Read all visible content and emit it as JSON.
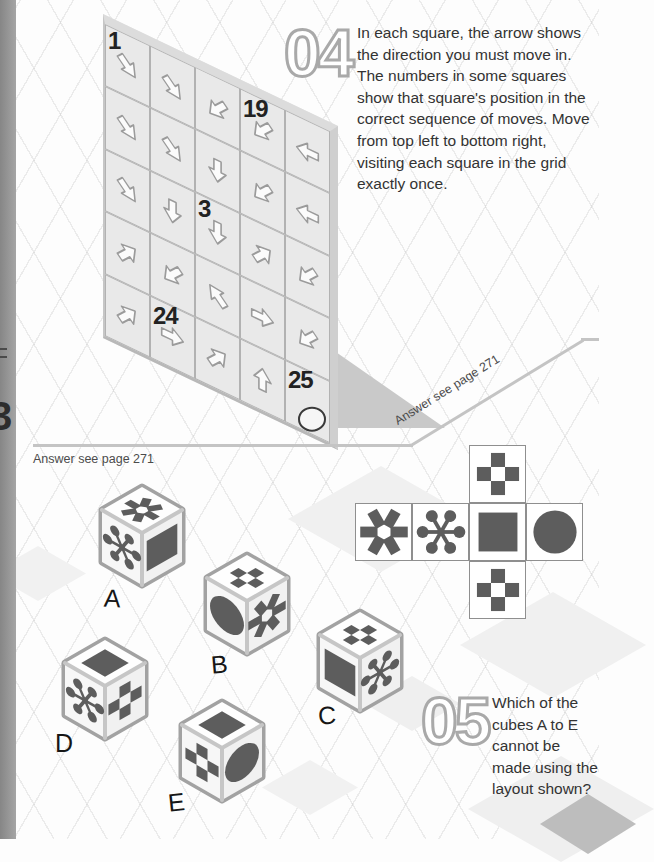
{
  "page_edge": {
    "label": "3"
  },
  "puzzle04": {
    "number": "04",
    "description": "In each square, the arrow shows the direction you must move in. The numbers in some squares show that square's position in the correct sequence of moves. Move from top left to bottom right, visiting each square in the grid exactly once.",
    "answer_note": "Answer see page 271",
    "grid": {
      "rows": 5,
      "cols": 5,
      "cells": [
        {
          "num": "1",
          "dir": "SE"
        },
        {
          "dir": "SE"
        },
        {
          "dir": "SW"
        },
        {
          "num": "19",
          "dir": "SW"
        },
        {
          "dir": "W"
        },
        {
          "dir": "SE"
        },
        {
          "dir": "SE"
        },
        {
          "dir": "S"
        },
        {
          "dir": "SW"
        },
        {
          "dir": "W"
        },
        {
          "dir": "SE"
        },
        {
          "dir": "S"
        },
        {
          "num": "3",
          "dir": "S"
        },
        {
          "dir": "NE"
        },
        {
          "dir": "SW"
        },
        {
          "dir": "NE"
        },
        {
          "dir": "SW"
        },
        {
          "dir": "NW"
        },
        {
          "dir": "E"
        },
        {
          "dir": "SW"
        },
        {
          "dir": "NE"
        },
        {
          "num": "24",
          "dir": "E"
        },
        {
          "dir": "NE"
        },
        {
          "dir": "N"
        },
        {
          "num": "25",
          "end": true
        }
      ]
    }
  },
  "puzzle05": {
    "number": "05",
    "question": "Which of the cubes A to E cannot be made using the layout shown?",
    "answer_note": "Answer see page 271",
    "net": {
      "middle_row": [
        "six-blade-asterisk",
        "six-dot-snowflake",
        "solid-square",
        "solid-circle"
      ],
      "above_third": "checkered-plus",
      "below_third": "checkered-plus"
    },
    "dice": [
      {
        "label": "A",
        "top": "six-blade-asterisk",
        "left": "six-dot-snowflake",
        "right": "solid-square"
      },
      {
        "label": "B",
        "top": "checkered-plus",
        "left": "solid-circle",
        "right": "six-blade-asterisk"
      },
      {
        "label": "C",
        "top": "checkered-plus",
        "left": "solid-square",
        "right": "six-dot-snowflake"
      },
      {
        "label": "D",
        "top": "solid-square",
        "left": "six-dot-snowflake",
        "right": "checkered-plus"
      },
      {
        "label": "E",
        "top": "solid-square",
        "left": "checkered-plus",
        "right": "solid-circle"
      }
    ]
  },
  "colors": {
    "shape_dark": "#5d5d5d",
    "wall_face": "#e9e9e9",
    "grid_line": "#b2b2b2",
    "divider": "#c4c4c4",
    "page_edge": "#949494",
    "shadow": "#c9c9c9"
  }
}
